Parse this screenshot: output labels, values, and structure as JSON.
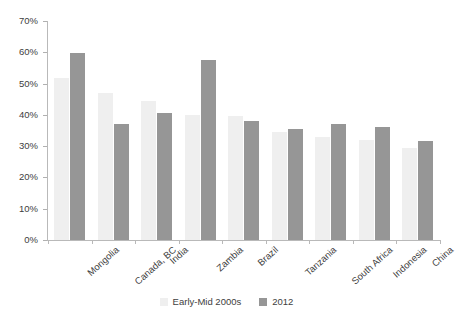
{
  "chart_data": {
    "type": "bar",
    "title": "",
    "subtitle": "",
    "xlabel": "",
    "ylabel": "",
    "ylim": [
      0,
      70
    ],
    "ytick_values": [
      0,
      10,
      20,
      30,
      40,
      50,
      60,
      70
    ],
    "ytick_labels": [
      "0%",
      "10%",
      "20%",
      "30%",
      "40%",
      "50%",
      "60%",
      "70%"
    ],
    "grid": false,
    "legend_position": "bottom",
    "categories": [
      "Mongolia",
      "Canada, BC",
      "India",
      "Zambia",
      "Brazil",
      "Tanzania",
      "South Africa",
      "Indonesia",
      "China"
    ],
    "series": [
      {
        "name": "Early-Mid 2000s",
        "color": "#efefef",
        "values": [
          51.8,
          47.0,
          44.5,
          40.0,
          39.5,
          34.5,
          33.0,
          32.0,
          29.5
        ]
      },
      {
        "name": "2012",
        "color": "#969696",
        "values": [
          59.7,
          37.0,
          40.5,
          57.5,
          38.0,
          35.5,
          37.0,
          36.0,
          31.5
        ]
      }
    ]
  },
  "legend": {
    "items": [
      {
        "label": "Early-Mid 2000s",
        "color": "#efefef"
      },
      {
        "label": "2012",
        "color": "#969696"
      }
    ]
  },
  "colors": {
    "series_early_mid_2000s": "#efefef",
    "series_2012": "#969696",
    "axis": "#b9b9b9",
    "text": "#404040",
    "background": "#ffffff"
  }
}
